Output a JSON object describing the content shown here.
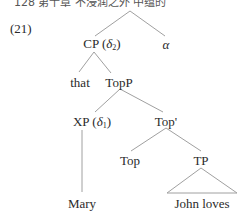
{
  "header_partial": "128  第十章  不浸润之外  中蕴的",
  "example_number": "(21)",
  "line_color": "#a0a0a0",
  "nodes": {
    "cp": {
      "label": "CP",
      "paren_open": "(",
      "delta": "δ",
      "sub": "2",
      "paren_close": ")"
    },
    "alpha": {
      "label": "α"
    },
    "that": {
      "label": "that"
    },
    "topp": {
      "label": "TopP"
    },
    "xp": {
      "label": "XP",
      "paren_open": "(",
      "delta": "δ",
      "sub": "1",
      "paren_close": ")"
    },
    "topbar": {
      "label": "Top'"
    },
    "top": {
      "label": "Top"
    },
    "tp": {
      "label": "TP"
    },
    "mary": {
      "label": "Mary"
    },
    "john_loves": {
      "label": "John loves"
    }
  }
}
